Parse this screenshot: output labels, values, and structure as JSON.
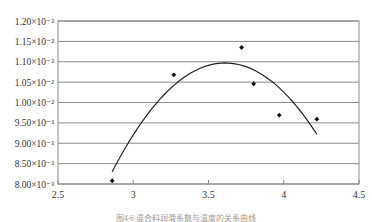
{
  "chart_data": {
    "type": "scatter",
    "title": "",
    "caption": "图4-6 混合料润滑系数与温度的关系曲线",
    "xlabel": "",
    "ylabel": "",
    "xlim": [
      2.5,
      4.5
    ],
    "ylim": [
      0.008,
      0.012
    ],
    "grid": {
      "horizontal": true,
      "vertical": false
    },
    "legend": null,
    "x_ticks": [
      "2.5",
      "3",
      "3.5",
      "4",
      "4.5"
    ],
    "x_tick_values": [
      2.5,
      3,
      3.5,
      4,
      4.5
    ],
    "y_ticks": [
      "8.00×10⁻³",
      "8.50×10⁻³",
      "9.00×10⁻³",
      "9.50×10⁻³",
      "1.00×10⁻²",
      "1.05×10⁻²",
      "1.10×10⁻²",
      "1.15×10⁻²",
      "1.20×10⁻²"
    ],
    "y_tick_values": [
      0.008,
      0.0085,
      0.009,
      0.0095,
      0.01,
      0.0105,
      0.011,
      0.0115,
      0.012
    ],
    "series": [
      {
        "name": "data points",
        "type": "scatter",
        "marker": "diamond",
        "color": "#111111",
        "points": [
          {
            "x": 2.86,
            "y": 0.00808
          },
          {
            "x": 3.27,
            "y": 0.01068
          },
          {
            "x": 3.72,
            "y": 0.01135
          },
          {
            "x": 3.8,
            "y": 0.01046
          },
          {
            "x": 3.97,
            "y": 0.00969
          },
          {
            "x": 4.22,
            "y": 0.00959
          }
        ]
      },
      {
        "name": "fitted curve",
        "type": "line",
        "fit": "polynomial (quadratic)",
        "color": "#222222",
        "x_range": [
          2.86,
          4.22
        ],
        "vertex": {
          "x": 3.61,
          "y": 0.01097
        },
        "endpoints": [
          {
            "x": 2.86,
            "y": 0.0083
          },
          {
            "x": 4.22,
            "y": 0.00922
          }
        ]
      }
    ]
  }
}
